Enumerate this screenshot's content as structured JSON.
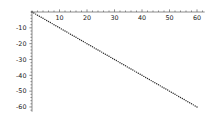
{
  "chart_data": {
    "type": "line",
    "title": "",
    "subtitle": "",
    "xlabel": "",
    "ylabel": "",
    "xlim": [
      0,
      62
    ],
    "ylim": [
      -62,
      0
    ],
    "grid": false,
    "legend": false,
    "legend_position": "none",
    "line_style": "dotted",
    "marker": "dot",
    "series_color": "#2b2b2b",
    "axis_color": "#6e6e6e",
    "xticks": [
      10,
      20,
      30,
      40,
      50,
      60
    ],
    "yticks": [
      -10,
      -20,
      -30,
      -40,
      -50,
      -60
    ],
    "xtick_labels": [
      "10",
      "20",
      "30",
      "40",
      "50",
      "60"
    ],
    "ytick_labels": [
      "-10",
      "-20",
      "-30",
      "-40",
      "-50",
      "-60"
    ],
    "x_axis_position": "top",
    "y_axis_position": "left",
    "series": [
      {
        "name": "",
        "x": [
          0,
          2,
          4,
          6,
          8,
          10,
          12,
          14,
          16,
          18,
          20,
          22,
          24,
          26,
          28,
          30,
          32,
          34,
          36,
          38,
          40,
          42,
          44,
          46,
          48,
          50,
          52,
          54,
          56,
          58,
          60
        ],
        "values": [
          0,
          -2,
          -4,
          -6,
          -8,
          -10,
          -12,
          -14,
          -16,
          -18,
          -20,
          -22,
          -24,
          -26,
          -28,
          -30,
          -32,
          -34,
          -36,
          -38,
          -40,
          -42,
          -44,
          -46,
          -48,
          -50,
          -52,
          -54,
          -56,
          -58,
          -60
        ]
      }
    ],
    "annotations": []
  }
}
